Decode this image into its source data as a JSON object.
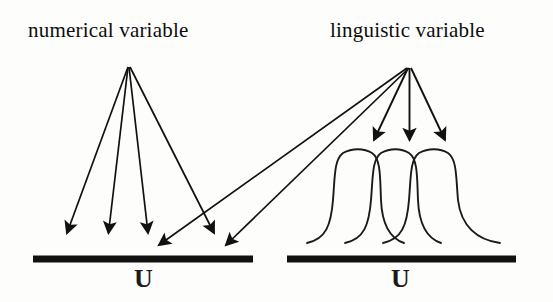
{
  "figure": {
    "background_color": "#fdfdfc",
    "ink_color": "#111111"
  },
  "panels": {
    "left": {
      "label": "numerical variable",
      "axis_label": "U",
      "apex": {
        "x": 128,
        "y": 66
      },
      "baseline": {
        "x1": 33,
        "x2": 253,
        "y": 259,
        "thickness": 7
      },
      "arrow_targets_x": [
        66,
        108,
        148,
        215
      ],
      "arrow_count": 4,
      "description": "point-valued mapping: each arrow hits a single point of U"
    },
    "right": {
      "label": "linguistic variable",
      "axis_label": "U",
      "apex": {
        "x": 409,
        "y": 66
      },
      "baseline": {
        "x1": 287,
        "x2": 516,
        "y": 259,
        "thickness": 7
      },
      "arrow_targets_x": [
        373,
        410,
        447
      ],
      "arrow_count": 3,
      "membership_curves": 3,
      "description": "fuzzy-set mapping: each arrow hits a membership function over U"
    }
  },
  "cross_arrows": {
    "count": 2,
    "from": "right apex",
    "to_x": [
      152,
      219
    ],
    "to_y": 255,
    "description": "diagonal arrows from linguistic apex down to the numerical universe U"
  },
  "membership_curves": [
    {
      "name": "curve-1",
      "left_tail_x": 307,
      "plateau_x1": 343,
      "plateau_x2": 372,
      "right_tail_x": 381,
      "top_y": 150,
      "base_y": 243
    },
    {
      "name": "curve-2",
      "left_tail_x": 345,
      "plateau_x1": 380,
      "plateau_x2": 409,
      "right_tail_x": 419,
      "top_y": 150,
      "base_y": 243
    },
    {
      "name": "curve-3",
      "left_tail_x": 383,
      "plateau_x1": 418,
      "plateau_x2": 447,
      "right_tail_x": 500,
      "top_y": 150,
      "base_y": 243
    }
  ]
}
